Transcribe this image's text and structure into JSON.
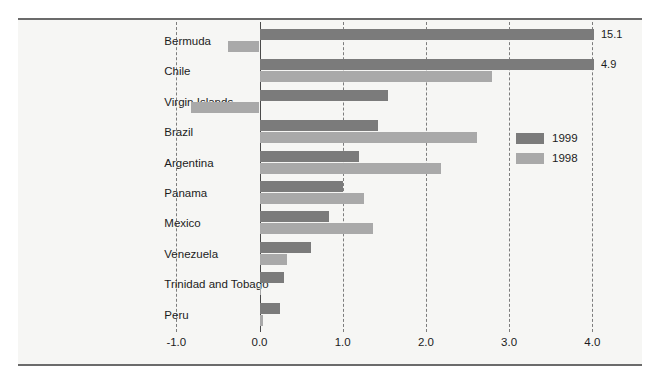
{
  "chart_data": {
    "type": "bar",
    "orientation": "horizontal",
    "title": "",
    "subtitle": "",
    "xlabel": "",
    "ylabel": "",
    "xlim": [
      -1.0,
      4.2
    ],
    "xticks": [
      -1.0,
      0.0,
      1.0,
      2.0,
      3.0,
      4.0
    ],
    "xtick_labels": [
      "-1.0",
      "0.0",
      "1.0",
      "2.0",
      "3.0",
      "4.0"
    ],
    "grid": "vertical-dashed",
    "legend_position": "inside-right",
    "categories": [
      "Bermuda",
      "Chile",
      "Virgin Islands",
      "Brazil",
      "Argentina",
      "Panama",
      "Mexico",
      "Venezuela",
      "Trinidad and Tobago",
      "Peru"
    ],
    "series": [
      {
        "name": "1999",
        "color": "#7b7b7b",
        "values": [
          15.1,
          4.9,
          1.55,
          1.42,
          1.2,
          1.0,
          0.84,
          0.62,
          0.29,
          0.25
        ]
      },
      {
        "name": "1998",
        "color": "#a9a9a9",
        "values": [
          -0.38,
          2.8,
          -0.82,
          2.61,
          2.18,
          1.25,
          1.37,
          0.33,
          0.01,
          0.04
        ]
      }
    ],
    "annotations": [
      {
        "series": "1999",
        "category": "Bermuda",
        "label": "15.1",
        "note": "value exceeds axis, bar clipped at 4.0"
      },
      {
        "series": "1999",
        "category": "Chile",
        "label": "4.9",
        "note": "value exceeds axis, bar clipped at 4.0"
      }
    ]
  },
  "legend": {
    "items": [
      {
        "label": "1999",
        "color": "#7b7b7b"
      },
      {
        "label": "1998",
        "color": "#a9a9a9"
      }
    ]
  }
}
